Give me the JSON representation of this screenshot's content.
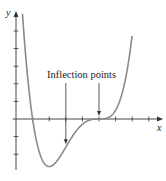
{
  "chart_data": {
    "type": "line",
    "title": "",
    "xlabel": "x",
    "ylabel": "y",
    "xlim": [
      -0.2,
      8.8
    ],
    "ylim": [
      -3,
      6.1
    ],
    "x_ticks": [
      1,
      2,
      3,
      4,
      5,
      6,
      7,
      8
    ],
    "y_ticks": [
      -2,
      -1,
      1,
      2,
      3,
      4,
      5
    ],
    "tick_labels_shown": false,
    "grid": false,
    "series": [
      {
        "name": "f(x) = 0.1(x-5)^3(x-1)",
        "function": {
          "k": 0.1,
          "triple_root": 5,
          "simple_root": 1
        },
        "x_range": [
          0.15,
          7.0
        ],
        "color": "#8a8a8a"
      }
    ],
    "annotations": [
      {
        "text": "Inflection points",
        "arrows_to": [
          {
            "x": 3,
            "y": -1.6
          },
          {
            "x": 5,
            "y": 0
          }
        ]
      }
    ]
  }
}
